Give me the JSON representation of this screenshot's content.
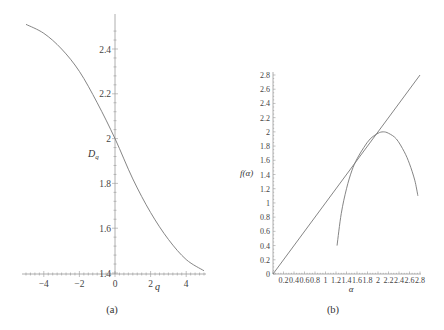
{
  "chart_data": [
    {
      "id": "a",
      "type": "line",
      "caption": "(a)",
      "xlabel": "q",
      "ylabel": "D_q",
      "xlim": [
        -5.0,
        5.0
      ],
      "ylim": [
        1.4,
        2.52
      ],
      "x_ticks": [
        "-4",
        "-2",
        "0",
        "2",
        "4"
      ],
      "y_ticks": [
        "1.4",
        "1.6",
        "1.8",
        "2",
        "2.2",
        "2.4"
      ],
      "grid": false,
      "series": [
        {
          "name": "D_q",
          "x": [
            -5,
            -4,
            -3,
            -2,
            -1,
            0,
            1,
            2,
            3,
            4,
            5
          ],
          "y": [
            2.51,
            2.47,
            2.4,
            2.3,
            2.16,
            2.0,
            1.82,
            1.67,
            1.55,
            1.46,
            1.41
          ]
        }
      ]
    },
    {
      "id": "b",
      "type": "line",
      "caption": "(b)",
      "xlabel": "α",
      "ylabel": "f(α)",
      "xlim": [
        0,
        2.8
      ],
      "ylim": [
        0,
        2.8
      ],
      "x_ticks": [
        "0.2",
        "0.4",
        "0.6",
        "0.8",
        "1",
        "1.2",
        "1.4",
        "1.6",
        "1.8",
        "2",
        "2.2",
        "2.4",
        "2.6",
        "2.8"
      ],
      "y_ticks": [
        "0",
        "0.2",
        "0.4",
        "0.6",
        "0.8",
        "1",
        "1.2",
        "1.4",
        "1.6",
        "1.8",
        "2",
        "2.2",
        "2.4",
        "2.6",
        "2.8"
      ],
      "grid": false,
      "series": [
        {
          "name": "f(α) = α",
          "x": [
            0,
            2.8
          ],
          "y": [
            0,
            2.8
          ]
        },
        {
          "name": "f(α)",
          "x": [
            1.22,
            1.3,
            1.4,
            1.5,
            1.6,
            1.73,
            1.85,
            2.0,
            2.1,
            2.2,
            2.35,
            2.5,
            2.6,
            2.7,
            2.76
          ],
          "y": [
            0.4,
            0.85,
            1.2,
            1.45,
            1.62,
            1.78,
            1.9,
            1.98,
            2.0,
            1.98,
            1.9,
            1.72,
            1.55,
            1.32,
            1.1
          ]
        }
      ]
    }
  ]
}
